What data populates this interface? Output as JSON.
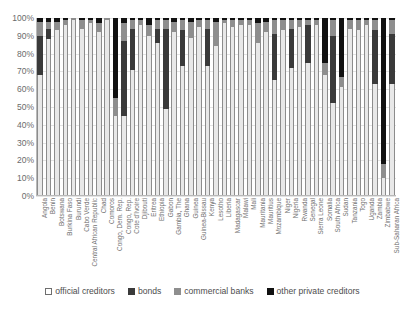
{
  "chart_data": {
    "type": "bar",
    "stacked": true,
    "stack_mode": "percent",
    "title": "",
    "xlabel": "",
    "ylabel": "",
    "ylim": [
      0,
      100
    ],
    "grid": true,
    "legend_position": "bottom",
    "ytick_labels": [
      "100%",
      "90%",
      "80%",
      "70%",
      "60%",
      "50%",
      "40%",
      "30%",
      "20%",
      "10%",
      "0%"
    ],
    "ytick_values": [
      100,
      90,
      80,
      70,
      60,
      50,
      40,
      30,
      20,
      10,
      0
    ],
    "legend": [
      "official creditors",
      "bonds",
      "commercial banks",
      "other private creditors"
    ],
    "colors": {
      "official creditors": "#e8e8e8",
      "bonds": "#3a3a3a",
      "commercial banks": "#8e8e8e",
      "other private creditors": "#111111"
    },
    "categories": [
      "Angola",
      "Benin",
      "Botswana",
      "Burkina Faso",
      "Burundi",
      "Cabo Verde",
      "Central African Republic",
      "Chad",
      "Comoros",
      "Congo, Dem. Rep.",
      "Congo, Rep.",
      "Cote d'Ivoire",
      "Djibouti",
      "Eritrea",
      "Ethiopia",
      "Gabon",
      "Gambia, The",
      "Ghana",
      "Guinea",
      "Guinea-Bissau",
      "Kenya",
      "Lesotho",
      "Liberia",
      "Madagascar",
      "Malawi",
      "Mali",
      "Mauritania",
      "Mauritius",
      "Mozambique",
      "Niger",
      "Nigeria",
      "Rwanda",
      "Senegal",
      "Sierra Leone",
      "Somalia",
      "South Africa",
      "Sudan",
      "Tanzania",
      "Togo",
      "Uganda",
      "Zambia",
      "Zimbabwe",
      "Sub-Saharan Africa"
    ],
    "series": [
      {
        "name": "official creditors",
        "values": [
          68,
          88,
          93,
          96,
          99,
          94,
          97,
          92,
          99,
          45,
          45,
          71,
          96,
          90,
          86,
          49,
          92,
          73,
          89,
          95,
          73,
          84,
          97,
          95,
          96,
          96,
          86,
          92,
          65,
          93,
          72,
          95,
          75,
          96,
          68,
          52,
          61,
          94,
          93,
          96,
          63,
          10,
          63
        ]
      },
      {
        "name": "bonds",
        "values": [
          22,
          6,
          0,
          0,
          0,
          0,
          0,
          0,
          0,
          0,
          42,
          23,
          0,
          0,
          8,
          45,
          0,
          20,
          0,
          0,
          21,
          0,
          0,
          0,
          0,
          0,
          0,
          0,
          26,
          0,
          22,
          0,
          21,
          0,
          0,
          38,
          0,
          0,
          0,
          0,
          30,
          0,
          28
        ]
      },
      {
        "name": "commercial banks",
        "values": [
          8,
          4,
          5,
          3,
          1,
          5,
          2,
          5,
          1,
          10,
          10,
          5,
          3,
          6,
          5,
          5,
          6,
          6,
          9,
          4,
          5,
          14,
          2,
          4,
          3,
          3,
          11,
          6,
          8,
          6,
          5,
          4,
          3,
          3,
          7,
          9,
          6,
          5,
          6,
          3,
          6,
          8,
          8
        ]
      },
      {
        "name": "other private creditors",
        "values": [
          2,
          2,
          2,
          1,
          0,
          1,
          1,
          3,
          0,
          45,
          3,
          1,
          1,
          4,
          1,
          1,
          2,
          1,
          2,
          1,
          1,
          2,
          1,
          1,
          1,
          1,
          3,
          2,
          1,
          1,
          1,
          1,
          1,
          1,
          25,
          1,
          33,
          1,
          1,
          1,
          1,
          82,
          1
        ]
      }
    ]
  }
}
